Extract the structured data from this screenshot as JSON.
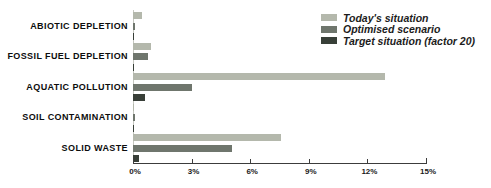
{
  "chart_data": {
    "type": "bar",
    "orientation": "horizontal",
    "title": "",
    "categories": [
      "ABIOTIC DEPLETION",
      "FOSSIL FUEL DEPLETION",
      "AQUATIC POLLUTION",
      "SOIL CONTAMINATION",
      "SOLID WASTE"
    ],
    "series": [
      {
        "name": "Today's situation",
        "color": "#b4b8ac",
        "values": [
          0.45,
          0.9,
          12.9,
          0.07,
          7.6
        ]
      },
      {
        "name": "Optimised scenario",
        "color": "#6f766d",
        "values": [
          0.1,
          0.75,
          3.0,
          0.1,
          5.05
        ]
      },
      {
        "name": "Target situation (factor 20)",
        "color": "#383f38",
        "values": [
          0.05,
          0.07,
          0.6,
          0.07,
          0.3
        ]
      }
    ],
    "x_axis": {
      "ticks": [
        "0%",
        "3%",
        "6%",
        "9%",
        "12%",
        "15%"
      ],
      "tick_values": [
        0,
        3,
        6,
        9,
        12,
        15
      ],
      "min": 0,
      "max": 15,
      "unit": "%"
    },
    "ylabel": "",
    "xlabel": "",
    "grid": false,
    "legend_position": "top-right"
  },
  "colors": {
    "axis": "#3c3c3c",
    "zero_line": "#c6c8c1",
    "label_text": "#0d0d0d",
    "background": "#ffffff"
  }
}
